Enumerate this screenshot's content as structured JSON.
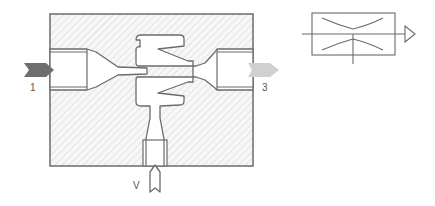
{
  "diagram": {
    "ports": [
      {
        "id": "supply",
        "label": "1",
        "color": "#6e6e6e"
      },
      {
        "id": "exhaust",
        "label": "3",
        "color": "#cfcfcf"
      },
      {
        "id": "vacuum",
        "label": "V",
        "color": "#ffffff"
      }
    ],
    "colors": {
      "outline": "#6b6b6b",
      "hatch": "#d9d9d9",
      "body_fill": "#f6f6f6",
      "supply_arrow": "#6e6e6e",
      "exhaust_arrow": "#cfcfcf"
    },
    "symbol": {
      "name": "ejector-symbol",
      "description": "Vacuum ejector schematic symbol with nozzle and exhaust triangle"
    }
  }
}
